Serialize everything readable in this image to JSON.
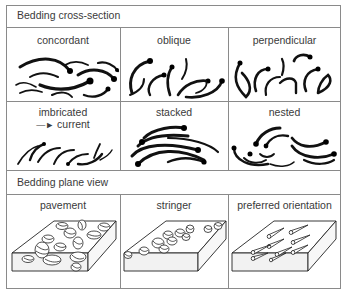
{
  "figure": {
    "sections": [
      {
        "title": "Bedding cross-section",
        "cells": [
          {
            "label": "concordant"
          },
          {
            "label": "oblique"
          },
          {
            "label": "perpendicular"
          },
          {
            "label": "imbricated",
            "sublabel": "current",
            "sublabel_icon": "right-arrow-icon"
          },
          {
            "label": "stacked"
          },
          {
            "label": "nested"
          }
        ]
      },
      {
        "title": "Bedding plane view",
        "cells": [
          {
            "label": "pavement"
          },
          {
            "label": "stringer"
          },
          {
            "label": "preferred orientation"
          }
        ]
      }
    ],
    "colors": {
      "border": "#8a8a8a",
      "ink": "#111111",
      "text": "#3a3a3a",
      "block_face": "#f2f2f2",
      "background": "#ffffff"
    }
  }
}
